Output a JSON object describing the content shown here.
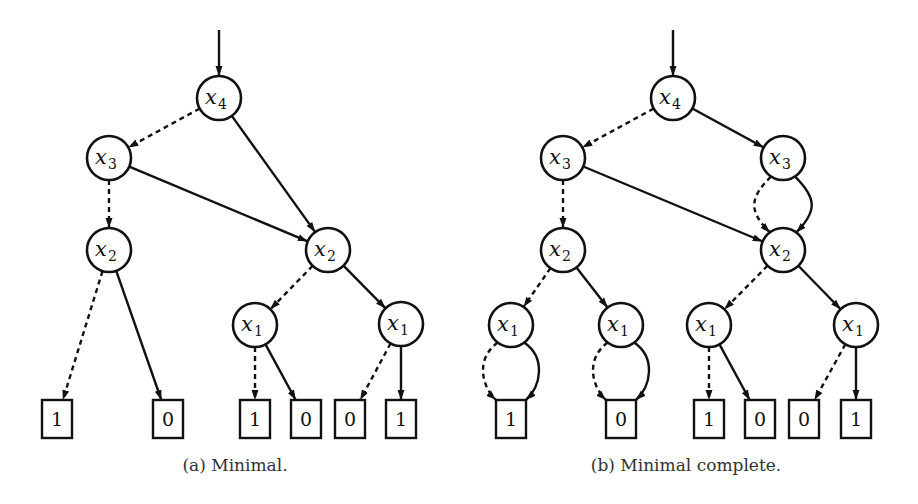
{
  "figure": {
    "subfigures": [
      {
        "id": "a",
        "caption": "(a) Minimal.",
        "nodes": [
          {
            "id": "a4",
            "type": "var",
            "var": "x",
            "sub": "4"
          },
          {
            "id": "a3",
            "type": "var",
            "var": "x",
            "sub": "3"
          },
          {
            "id": "a2L",
            "type": "var",
            "var": "x",
            "sub": "2"
          },
          {
            "id": "a2R",
            "type": "var",
            "var": "x",
            "sub": "2"
          },
          {
            "id": "a1L",
            "type": "var",
            "var": "x",
            "sub": "1"
          },
          {
            "id": "a1R",
            "type": "var",
            "var": "x",
            "sub": "1"
          },
          {
            "id": "aT1",
            "type": "terminal",
            "label": "1"
          },
          {
            "id": "aT2",
            "type": "terminal",
            "label": "0"
          },
          {
            "id": "aT3",
            "type": "terminal",
            "label": "1"
          },
          {
            "id": "aT4",
            "type": "terminal",
            "label": "0"
          },
          {
            "id": "aT5",
            "type": "terminal",
            "label": "0"
          },
          {
            "id": "aT6",
            "type": "terminal",
            "label": "1"
          }
        ],
        "edges": [
          {
            "from": "root",
            "to": "a4",
            "style": "solid"
          },
          {
            "from": "a4",
            "to": "a3",
            "style": "dashed"
          },
          {
            "from": "a4",
            "to": "a2R",
            "style": "solid"
          },
          {
            "from": "a3",
            "to": "a2L",
            "style": "dashed"
          },
          {
            "from": "a3",
            "to": "a2R",
            "style": "solid"
          },
          {
            "from": "a2L",
            "to": "aT1",
            "style": "dashed"
          },
          {
            "from": "a2L",
            "to": "aT2",
            "style": "solid"
          },
          {
            "from": "a2R",
            "to": "a1L",
            "style": "dashed"
          },
          {
            "from": "a2R",
            "to": "a1R",
            "style": "solid"
          },
          {
            "from": "a1L",
            "to": "aT3",
            "style": "dashed"
          },
          {
            "from": "a1L",
            "to": "aT4",
            "style": "solid"
          },
          {
            "from": "a1R",
            "to": "aT5",
            "style": "dashed"
          },
          {
            "from": "a1R",
            "to": "aT6",
            "style": "solid"
          }
        ]
      },
      {
        "id": "b",
        "caption": "(b) Minimal complete.",
        "nodes": [
          {
            "id": "b4",
            "type": "var",
            "var": "x",
            "sub": "4"
          },
          {
            "id": "b3L",
            "type": "var",
            "var": "x",
            "sub": "3"
          },
          {
            "id": "b3R",
            "type": "var",
            "var": "x",
            "sub": "3"
          },
          {
            "id": "b2L",
            "type": "var",
            "var": "x",
            "sub": "2"
          },
          {
            "id": "b2R",
            "type": "var",
            "var": "x",
            "sub": "2"
          },
          {
            "id": "b1a",
            "type": "var",
            "var": "x",
            "sub": "1"
          },
          {
            "id": "b1b",
            "type": "var",
            "var": "x",
            "sub": "1"
          },
          {
            "id": "b1c",
            "type": "var",
            "var": "x",
            "sub": "1"
          },
          {
            "id": "b1d",
            "type": "var",
            "var": "x",
            "sub": "1"
          },
          {
            "id": "bT1",
            "type": "terminal",
            "label": "1"
          },
          {
            "id": "bT2",
            "type": "terminal",
            "label": "0"
          },
          {
            "id": "bT3",
            "type": "terminal",
            "label": "1"
          },
          {
            "id": "bT4",
            "type": "terminal",
            "label": "0"
          },
          {
            "id": "bT5",
            "type": "terminal",
            "label": "0"
          },
          {
            "id": "bT6",
            "type": "terminal",
            "label": "1"
          }
        ],
        "edges": [
          {
            "from": "root",
            "to": "b4",
            "style": "solid"
          },
          {
            "from": "b4",
            "to": "b3L",
            "style": "dashed"
          },
          {
            "from": "b4",
            "to": "b3R",
            "style": "solid"
          },
          {
            "from": "b3L",
            "to": "b2L",
            "style": "dashed"
          },
          {
            "from": "b3L",
            "to": "b2R",
            "style": "solid"
          },
          {
            "from": "b3R",
            "to": "b2R",
            "style": "dashed",
            "curve": "left"
          },
          {
            "from": "b3R",
            "to": "b2R",
            "style": "solid",
            "curve": "right"
          },
          {
            "from": "b2L",
            "to": "b1a",
            "style": "dashed"
          },
          {
            "from": "b2L",
            "to": "b1b",
            "style": "solid"
          },
          {
            "from": "b2R",
            "to": "b1c",
            "style": "dashed"
          },
          {
            "from": "b2R",
            "to": "b1d",
            "style": "solid"
          },
          {
            "from": "b1a",
            "to": "bT1",
            "style": "dashed",
            "curve": "left"
          },
          {
            "from": "b1a",
            "to": "bT1",
            "style": "solid",
            "curve": "right"
          },
          {
            "from": "b1b",
            "to": "bT2",
            "style": "dashed",
            "curve": "left"
          },
          {
            "from": "b1b",
            "to": "bT2",
            "style": "solid",
            "curve": "right"
          },
          {
            "from": "b1c",
            "to": "bT3",
            "style": "dashed"
          },
          {
            "from": "b1c",
            "to": "bT4",
            "style": "solid"
          },
          {
            "from": "b1d",
            "to": "bT5",
            "style": "dashed"
          },
          {
            "from": "b1d",
            "to": "bT6",
            "style": "solid"
          }
        ]
      }
    ]
  }
}
